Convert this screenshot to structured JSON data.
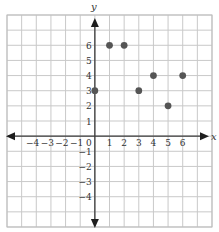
{
  "chart_data": {
    "type": "scatter",
    "title": "",
    "xlabel": "x",
    "ylabel": "y",
    "xlim": [
      -6,
      8
    ],
    "ylim": [
      -6,
      8
    ],
    "grid": true,
    "legend": null,
    "x_tick_labels": [
      "−4",
      "−3",
      "−2",
      "−1",
      "0",
      "1",
      "2",
      "3",
      "4",
      "5",
      "6"
    ],
    "x_tick_values": [
      -4,
      -3,
      -2,
      -1,
      0,
      1,
      2,
      3,
      4,
      5,
      6
    ],
    "y_tick_labels": [
      "6",
      "5",
      "4",
      "3",
      "2",
      "1",
      "−1",
      "−2",
      "−3",
      "−4"
    ],
    "y_tick_values": [
      6,
      5,
      4,
      3,
      2,
      1,
      -1,
      -2,
      -3,
      -4
    ],
    "series": [
      {
        "name": "points",
        "points": [
          {
            "x": 0,
            "y": 3
          },
          {
            "x": 1,
            "y": 6
          },
          {
            "x": 2,
            "y": 6
          },
          {
            "x": 3,
            "y": 3
          },
          {
            "x": 4,
            "y": 4
          },
          {
            "x": 5,
            "y": 2
          },
          {
            "x": 6,
            "y": 4
          }
        ]
      }
    ]
  },
  "colors": {
    "grid": "#c9c9c9",
    "axis": "#3a3a3a",
    "dot": "#555555",
    "text": "#333333"
  }
}
